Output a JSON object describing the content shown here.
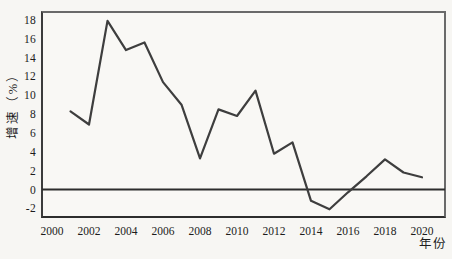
{
  "chart_data": {
    "type": "line",
    "xlabel": "年份",
    "ylabel": "增速（%）",
    "x": [
      2001,
      2002,
      2003,
      2004,
      2005,
      2006,
      2007,
      2008,
      2009,
      2010,
      2011,
      2012,
      2013,
      2014,
      2015,
      2016,
      2017,
      2018,
      2019,
      2020
    ],
    "values": [
      8.3,
      6.9,
      17.9,
      14.8,
      15.6,
      11.4,
      9.0,
      3.3,
      8.5,
      7.8,
      10.5,
      3.8,
      5.0,
      -1.2,
      -2.1,
      -0.3,
      1.4,
      3.2,
      1.8,
      1.3
    ],
    "x_ticks": [
      2000,
      2002,
      2004,
      2006,
      2008,
      2010,
      2012,
      2014,
      2016,
      2018,
      2020
    ],
    "y_ticks": [
      18,
      16,
      14,
      12,
      10,
      8,
      6,
      4,
      2,
      0,
      -2
    ],
    "xlim": [
      1999.4,
      2021.3
    ],
    "ylim": [
      -3.0,
      18.9
    ],
    "grid": false,
    "legend": "none",
    "zero_line": true,
    "colors": {
      "series_line": "#3e3e3e",
      "zero_line": "#2d2d2d",
      "frame": "#5a5a5a",
      "background": "#f7f6f3",
      "text": "#1c1c1c"
    }
  }
}
